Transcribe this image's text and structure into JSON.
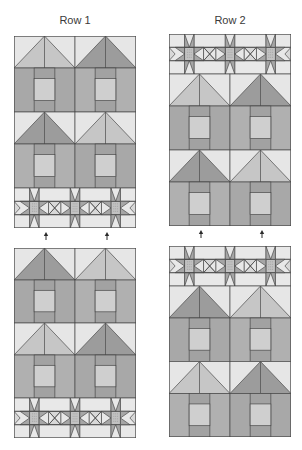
{
  "titles": {
    "row1": "Row 1",
    "row2": "Row 2"
  },
  "colors": {
    "outline": "#4a4a4a",
    "sky": "#e6e6e6",
    "roof_light": "#c6c6c6",
    "roof_dark": "#9c9c9c",
    "wall": "#a8a8a8",
    "wall_alt": "#b0b0b0",
    "door_frame": "#a2a2a2",
    "window": "#cfcfcf",
    "star_bg": "#e8e8e8",
    "star_center": "#c2c2c2",
    "star_point": "#a6a6a6",
    "hourglass": "#d8d8d8",
    "arrow": "#2a2a2a"
  },
  "panels": [
    {
      "name": "row1-top",
      "x": 14,
      "y": 36,
      "w": 122,
      "h": 192,
      "strips": [
        {
          "type": "house",
          "roofs": [
            "light",
            "dark"
          ]
        },
        {
          "type": "house",
          "roofs": [
            "dark",
            "light"
          ]
        },
        {
          "type": "star"
        }
      ]
    },
    {
      "name": "row1-bottom",
      "x": 14,
      "y": 248,
      "w": 122,
      "h": 190,
      "strips": [
        {
          "type": "house",
          "roofs": [
            "dark",
            "light"
          ]
        },
        {
          "type": "house",
          "roofs": [
            "light",
            "dark"
          ]
        },
        {
          "type": "star"
        }
      ]
    },
    {
      "name": "row2-top",
      "x": 169,
      "y": 34,
      "w": 122,
      "h": 192,
      "strips": [
        {
          "type": "star"
        },
        {
          "type": "house",
          "roofs": [
            "light",
            "dark"
          ]
        },
        {
          "type": "house",
          "roofs": [
            "dark",
            "light"
          ]
        }
      ]
    },
    {
      "name": "row2-bottom",
      "x": 169,
      "y": 246,
      "w": 122,
      "h": 191,
      "strips": [
        {
          "type": "star"
        },
        {
          "type": "house",
          "roofs": [
            "dark",
            "light"
          ]
        },
        {
          "type": "house",
          "roofs": [
            "light",
            "dark"
          ]
        }
      ]
    }
  ],
  "arrows": [
    {
      "name": "row1-arrow-left",
      "x": 46,
      "y1": 240,
      "y2": 233
    },
    {
      "name": "row1-arrow-right",
      "x": 107,
      "y1": 240,
      "y2": 233
    },
    {
      "name": "row2-arrow-left",
      "x": 201,
      "y1": 238,
      "y2": 231
    },
    {
      "name": "row2-arrow-right",
      "x": 262,
      "y1": 238,
      "y2": 231
    }
  ]
}
